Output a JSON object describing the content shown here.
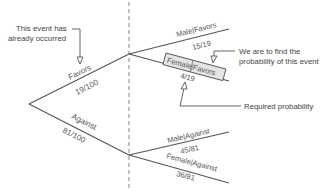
{
  "diagram": {
    "type": "probability-tree",
    "divider": "dashed-vertical",
    "root": {
      "branches": [
        {
          "event": "Favors",
          "probability": "19/100",
          "children": [
            {
              "event": "Male|Favors",
              "probability": "15/19"
            },
            {
              "event": "Female|Favors",
              "probability": "4/19",
              "highlighted": true
            }
          ]
        },
        {
          "event": "Against",
          "probability": "81/100",
          "children": [
            {
              "event": "Male|Against",
              "probability": "45/81"
            },
            {
              "event": "Female|Against",
              "probability": "36/81"
            }
          ]
        }
      ]
    },
    "annotations": {
      "occurred_line1": "This event has",
      "occurred_line2": "already occurred",
      "find_line1": "We are to find the",
      "find_line2": "probability of this event",
      "required": "Required probability"
    },
    "colors": {
      "line": "#555555",
      "text": "#555555",
      "highlight_box": "#e4e4e4"
    }
  }
}
